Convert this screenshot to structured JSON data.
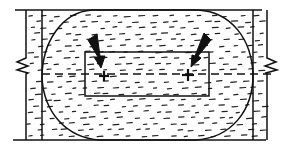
{
  "diagram": {
    "colors": {
      "background": "#ffffff",
      "ink": "#111111"
    },
    "frame": {
      "top_y": 10,
      "bottom_y": 140,
      "left_outer_x": 26,
      "left_inner_x": 42,
      "right_inner_x": 253,
      "right_outer_x": 267
    },
    "rounded_zone": {
      "x": 42,
      "y": 10,
      "width": 211,
      "height": 130,
      "corner_radius": 65
    },
    "inner_rectangle": {
      "x": 85,
      "y": 52,
      "width": 124,
      "height": 44
    },
    "centerline_y": 74,
    "marked_points": [
      {
        "id": "left-point",
        "x": 104,
        "y": 76,
        "symbol": "+"
      },
      {
        "id": "right-point",
        "x": 188,
        "y": 75,
        "symbol": "+"
      }
    ],
    "arrows": [
      {
        "id": "left-arrow",
        "from": [
          92,
          36
        ],
        "to": [
          101,
          68
        ]
      },
      {
        "id": "right-arrow",
        "from": [
          206,
          36
        ],
        "to": [
          191,
          67
        ]
      }
    ],
    "break_marks": [
      {
        "id": "left-break",
        "side": "left"
      },
      {
        "id": "right-break",
        "side": "right"
      }
    ]
  }
}
